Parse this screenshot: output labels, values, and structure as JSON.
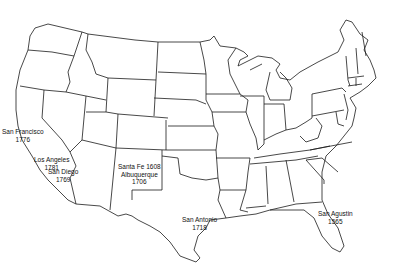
{
  "map": {
    "type": "outline map",
    "region": "Contiguous United States with state boundaries",
    "stroke_color": "#1a1a1a",
    "background": "#ffffff"
  },
  "settlements": [
    {
      "id": "san-francisco",
      "name": "San Francisco",
      "year": "1776",
      "x": 2,
      "y": 130
    },
    {
      "id": "los-angeles",
      "name": "Los Angeles",
      "year": "1781",
      "x": 34,
      "y": 160
    },
    {
      "id": "san-diego",
      "name": "San Diego",
      "year": "1769",
      "x": 48,
      "y": 172
    },
    {
      "id": "santa-fe",
      "name": "Santa Fe 1608",
      "year": "",
      "x": 118,
      "y": 163
    },
    {
      "id": "albuquerque",
      "name": "Albuquerque",
      "year": "1706",
      "x": 120,
      "y": 171
    },
    {
      "id": "san-antonio",
      "name": "San Antonio",
      "year": "1718",
      "x": 182,
      "y": 215
    },
    {
      "id": "san-agustin",
      "name": "San Agustin",
      "year": "1565",
      "x": 318,
      "y": 212
    }
  ]
}
